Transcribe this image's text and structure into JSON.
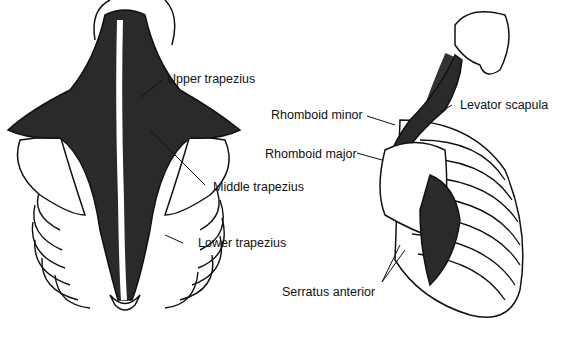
{
  "figure": {
    "left_view": "posterior view of back",
    "right_view": "lateral view of thorax"
  },
  "labels": {
    "upper_trapezius": "Upper trapezius",
    "middle_trapezius": "Middle trapezius",
    "lower_trapezius": "Lower trapezius",
    "rhomboid_minor": "Rhomboid minor",
    "rhomboid_major": "Rhomboid major",
    "levator_scapula": "Levator scapula",
    "serratus_anterior": "Serratus anterior"
  },
  "colors": {
    "muscle": "#2a2a2a",
    "outline": "#111111",
    "bone": "#ffffff"
  }
}
